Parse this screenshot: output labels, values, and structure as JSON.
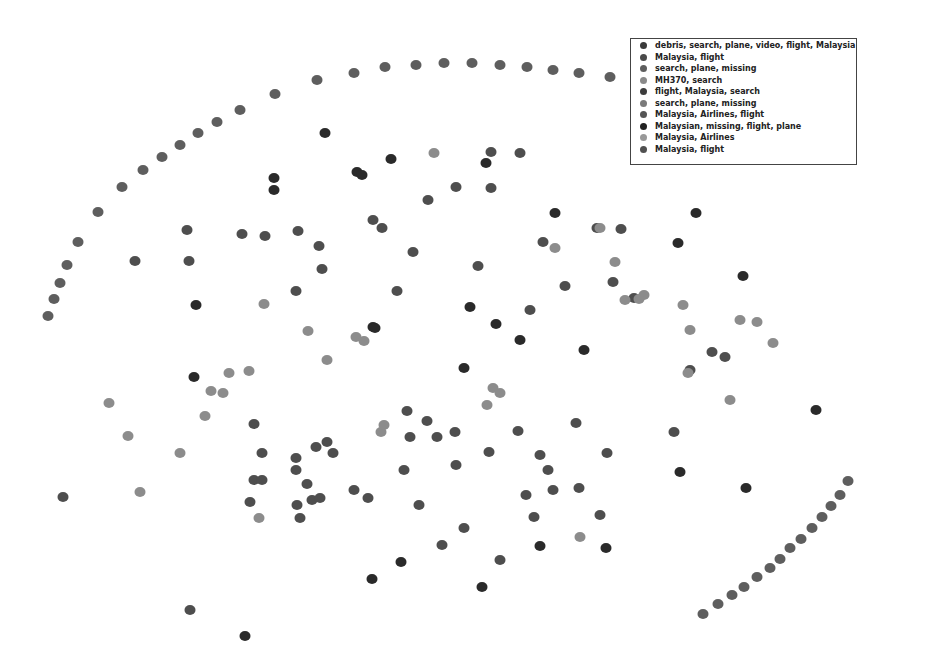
{
  "chart_data": {
    "type": "scatter",
    "title": "",
    "xlabel": "",
    "ylabel": "",
    "grid": false,
    "axes_visible": false,
    "legend_position": "upper right",
    "legend": [
      {
        "label": "debris, search, plane, video, flight, Malaysia",
        "color": "#3a3a3a"
      },
      {
        "label": "Malaysia, flight",
        "color": "#4a4a4a"
      },
      {
        "label": "search, plane, missing",
        "color": "#5e5e5e"
      },
      {
        "label": "MH370, search",
        "color": "#8a8a8a"
      },
      {
        "label": "flight, Malaysia, search",
        "color": "#3c3c3c"
      },
      {
        "label": "search, plane, missing",
        "color": "#7a7a7a"
      },
      {
        "label": "Malaysia, Airlines, flight",
        "color": "#555555"
      },
      {
        "label": "Malaysian, missing, flight, plane",
        "color": "#222222"
      },
      {
        "label": "Malaysia, Airlines",
        "color": "#999999"
      },
      {
        "label": "Malaysia, flight",
        "color": "#505050"
      }
    ],
    "series": [
      {
        "name": "arc-top",
        "color": "#5e5e5e",
        "points": [
          [
            48,
            316
          ],
          [
            54,
            299
          ],
          [
            60,
            283
          ],
          [
            67,
            265
          ],
          [
            78,
            242
          ],
          [
            98,
            212
          ],
          [
            122,
            187
          ],
          [
            143,
            170
          ],
          [
            162,
            157
          ],
          [
            180,
            145
          ],
          [
            198,
            133
          ],
          [
            217,
            122
          ],
          [
            240,
            110
          ],
          [
            275,
            94
          ],
          [
            317,
            80
          ],
          [
            354,
            73
          ],
          [
            385,
            67
          ],
          [
            416,
            65
          ],
          [
            444,
            63
          ],
          [
            472,
            63
          ],
          [
            500,
            65
          ],
          [
            527,
            67
          ],
          [
            553,
            70
          ],
          [
            579,
            73
          ],
          [
            610,
            77
          ]
        ]
      },
      {
        "name": "arc-bottom-right",
        "color": "#5e5e5e",
        "points": [
          [
            703,
            614
          ],
          [
            718,
            604
          ],
          [
            732,
            595
          ],
          [
            744,
            587
          ],
          [
            757,
            577
          ],
          [
            770,
            568
          ],
          [
            780,
            559
          ],
          [
            790,
            548
          ],
          [
            801,
            539
          ],
          [
            812,
            528
          ],
          [
            822,
            517
          ],
          [
            831,
            506
          ],
          [
            840,
            495
          ],
          [
            848,
            481
          ]
        ]
      },
      {
        "name": "dark",
        "color": "#2a2a2a",
        "points": [
          [
            274,
            178
          ],
          [
            274,
            190
          ],
          [
            325,
            133
          ],
          [
            357,
            172
          ],
          [
            362,
            175
          ],
          [
            391,
            159
          ],
          [
            486,
            163
          ],
          [
            196,
            305
          ],
          [
            555,
            213
          ],
          [
            696,
            213
          ],
          [
            678,
            243
          ],
          [
            743,
            276
          ],
          [
            470,
            307
          ],
          [
            373,
            327
          ],
          [
            496,
            324
          ],
          [
            584,
            350
          ],
          [
            194,
            377
          ],
          [
            375,
            328
          ],
          [
            520,
            340
          ],
          [
            464,
            368
          ],
          [
            816,
            410
          ],
          [
            746,
            488
          ],
          [
            680,
            472
          ],
          [
            606,
            548
          ],
          [
            401,
            562
          ],
          [
            372,
            579
          ],
          [
            245,
            636
          ],
          [
            482,
            587
          ],
          [
            540,
            546
          ]
        ]
      },
      {
        "name": "medium",
        "color": "#4e4e4e",
        "points": [
          [
            135,
            261
          ],
          [
            187,
            230
          ],
          [
            189,
            261
          ],
          [
            242,
            234
          ],
          [
            265,
            236
          ],
          [
            298,
            231
          ],
          [
            319,
            246
          ],
          [
            322,
            269
          ],
          [
            373,
            220
          ],
          [
            382,
            228
          ],
          [
            413,
            252
          ],
          [
            456,
            187
          ],
          [
            491,
            152
          ],
          [
            520,
            153
          ],
          [
            491,
            188
          ],
          [
            428,
            200
          ],
          [
            543,
            242
          ],
          [
            597,
            228
          ],
          [
            621,
            229
          ],
          [
            478,
            266
          ],
          [
            565,
            286
          ],
          [
            613,
            282
          ],
          [
            634,
            298
          ],
          [
            397,
            291
          ],
          [
            296,
            291
          ],
          [
            254,
            424
          ],
          [
            262,
            453
          ],
          [
            254,
            480
          ],
          [
            262,
            480
          ],
          [
            250,
            502
          ],
          [
            296,
            458
          ],
          [
            296,
            470
          ],
          [
            297,
            505
          ],
          [
            300,
            518
          ],
          [
            307,
            484
          ],
          [
            312,
            500
          ],
          [
            320,
            498
          ],
          [
            316,
            447
          ],
          [
            327,
            442
          ],
          [
            333,
            453
          ],
          [
            354,
            490
          ],
          [
            368,
            498
          ],
          [
            404,
            470
          ],
          [
            410,
            437
          ],
          [
            427,
            421
          ],
          [
            437,
            437
          ],
          [
            407,
            411
          ],
          [
            455,
            432
          ],
          [
            456,
            465
          ],
          [
            489,
            452
          ],
          [
            518,
            431
          ],
          [
            540,
            455
          ],
          [
            548,
            470
          ],
          [
            553,
            490
          ],
          [
            526,
            495
          ],
          [
            579,
            488
          ],
          [
            600,
            515
          ],
          [
            534,
            517
          ],
          [
            464,
            528
          ],
          [
            419,
            505
          ],
          [
            442,
            545
          ],
          [
            500,
            560
          ],
          [
            674,
            432
          ],
          [
            690,
            370
          ],
          [
            712,
            352
          ],
          [
            725,
            357
          ],
          [
            607,
            453
          ],
          [
            63,
            497
          ],
          [
            190,
            610
          ],
          [
            576,
            423
          ],
          [
            530,
            310
          ]
        ]
      },
      {
        "name": "light",
        "color": "#8c8c8c",
        "points": [
          [
            264,
            304
          ],
          [
            308,
            331
          ],
          [
            327,
            360
          ],
          [
            356,
            337
          ],
          [
            364,
            341
          ],
          [
            229,
            373
          ],
          [
            249,
            371
          ],
          [
            211,
            391
          ],
          [
            223,
            393
          ],
          [
            109,
            403
          ],
          [
            128,
            436
          ],
          [
            205,
            416
          ],
          [
            180,
            453
          ],
          [
            140,
            492
          ],
          [
            259,
            518
          ],
          [
            381,
            432
          ],
          [
            384,
            425
          ],
          [
            493,
            388
          ],
          [
            500,
            393
          ],
          [
            487,
            405
          ],
          [
            434,
            153
          ],
          [
            600,
            228
          ],
          [
            625,
            300
          ],
          [
            644,
            295
          ],
          [
            690,
            330
          ],
          [
            740,
            320
          ],
          [
            757,
            322
          ],
          [
            773,
            343
          ],
          [
            688,
            373
          ],
          [
            730,
            400
          ],
          [
            580,
            537
          ],
          [
            683,
            305
          ],
          [
            639,
            299
          ],
          [
            555,
            248
          ],
          [
            615,
            262
          ]
        ]
      }
    ]
  }
}
